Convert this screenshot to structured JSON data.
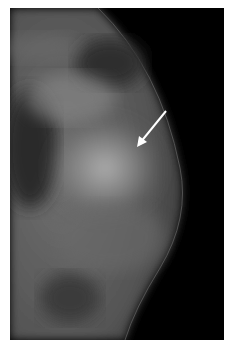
{
  "image": {
    "type": "mammogram",
    "background_color": "#ffffff",
    "frame_color": "#000000",
    "annotation": {
      "kind": "arrow",
      "color": "#ffffff",
      "from": [
        166,
        111
      ],
      "to": [
        137,
        146
      ]
    }
  }
}
